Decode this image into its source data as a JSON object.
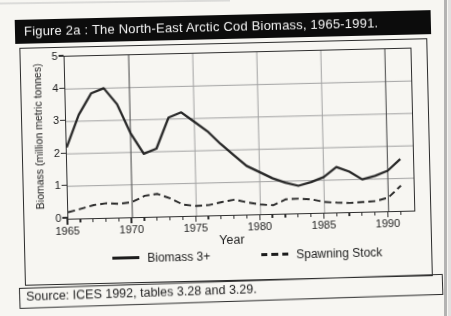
{
  "title_bar": {
    "text": "Figure 2a : The North-East Arctic Cod Biomass, 1965-1991."
  },
  "source_bar": {
    "text": "Source: ICES 1992, tables 3.28 and 3.29."
  },
  "chart_data": {
    "type": "line",
    "title": "The North-East Arctic Cod Biomass, 1965-1991",
    "xlabel": "Year",
    "ylabel": "Biomass (million metric tonnes)",
    "x_range": [
      1965,
      1992
    ],
    "y_range": [
      0,
      5
    ],
    "x_major_ticks": [
      1965,
      1970,
      1975,
      1980,
      1985,
      1990
    ],
    "x_minor_tick_interval": 1,
    "y_ticks": [
      0,
      1,
      2,
      3,
      4,
      5
    ],
    "grid": {
      "horizontal_at": [
        1,
        2,
        3,
        4
      ],
      "vertical_at": [
        1970,
        1975,
        1980,
        1985,
        1990
      ],
      "dark_vertical_at": [
        1970,
        1990
      ]
    },
    "legend_position": "below x-axis",
    "years": [
      1965,
      1966,
      1967,
      1968,
      1969,
      1970,
      1971,
      1972,
      1973,
      1974,
      1975,
      1976,
      1977,
      1978,
      1979,
      1980,
      1981,
      1982,
      1983,
      1984,
      1985,
      1986,
      1987,
      1988,
      1989,
      1990,
      1991
    ],
    "series": [
      {
        "name": "Biomass 3+",
        "line_style": "solid",
        "values": [
          2.2,
          3.2,
          3.85,
          4.0,
          3.5,
          2.6,
          1.95,
          2.1,
          3.05,
          3.2,
          2.9,
          2.6,
          2.2,
          1.85,
          1.5,
          1.3,
          1.1,
          0.95,
          0.85,
          0.95,
          1.1,
          1.4,
          1.25,
          1.0,
          1.1,
          1.25,
          1.6
        ]
      },
      {
        "name": "Spawning Stock",
        "line_style": "dashed",
        "values": [
          0.2,
          0.3,
          0.4,
          0.45,
          0.42,
          0.47,
          0.65,
          0.7,
          0.55,
          0.35,
          0.3,
          0.32,
          0.4,
          0.47,
          0.37,
          0.3,
          0.27,
          0.44,
          0.45,
          0.42,
          0.33,
          0.3,
          0.28,
          0.3,
          0.32,
          0.42,
          0.78
        ]
      }
    ]
  },
  "colors": {
    "paper": "#f7f6f2",
    "line": "#1d1d1d",
    "grid_light": "#a3a3a3",
    "grid_dark": "#5a5a5a",
    "axis": "#2e2e2e",
    "title_bar_bg": "#0c0c0c",
    "title_text": "#f4f4f4"
  }
}
